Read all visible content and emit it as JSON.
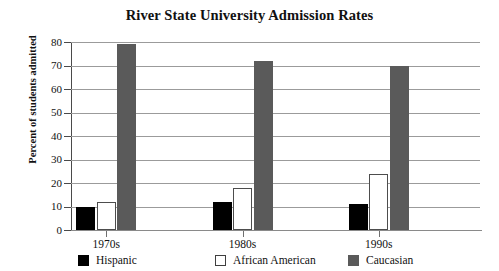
{
  "chart_data": {
    "type": "bar",
    "title": "River State University Admission Rates",
    "xlabel": "",
    "ylabel": "Percent of students admitted",
    "categories": [
      "1970s",
      "1980s",
      "1990s"
    ],
    "series": [
      {
        "name": "Hispanic",
        "color": "#000000",
        "values": [
          10,
          12,
          11
        ]
      },
      {
        "name": "African American",
        "color": "#ffffff",
        "values": [
          12,
          18,
          24
        ]
      },
      {
        "name": "Caucasian",
        "color": "#5a5a5a",
        "values": [
          79,
          72,
          70
        ]
      }
    ],
    "ylim": [
      0,
      80
    ],
    "ytick_values": [
      0,
      10,
      20,
      30,
      40,
      50,
      60,
      70,
      80
    ],
    "ytick_labels": [
      "0",
      "10",
      "20",
      "30",
      "40",
      "50",
      "60",
      "70",
      "80"
    ],
    "grid": true,
    "legend_position": "bottom"
  }
}
